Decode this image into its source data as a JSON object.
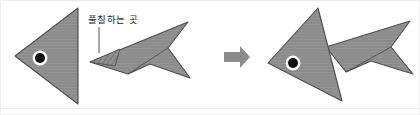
{
  "figure": {
    "title": "",
    "annotations": [
      {
        "id": "glue-label",
        "text": "풀칠하는 곳",
        "x": 88,
        "y": 15,
        "leader_line": {
          "x1": 99,
          "y1": 27,
          "x2": 99,
          "y2": 52
        }
      }
    ],
    "arrow": {
      "name": "process-arrow",
      "direction": "right",
      "x": 224,
      "y": 50,
      "width": 26,
      "height": 14
    },
    "colors": {
      "paper_fill": "#8c8c8c",
      "paper_fill_light": "#9a9a9a",
      "paper_fill_dark": "#808080",
      "outline": "#4d4d4d",
      "eye_pupil": "#111111",
      "eye_ring": "#ffffff",
      "arrow_fill": "#8c8c8c",
      "background": "#ffffff",
      "frame_border": "#e8e8e8",
      "hatch_stroke": "#5a5a5a"
    },
    "panels": [
      {
        "name": "before-assembly",
        "caption": "",
        "pieces": [
          {
            "name": "fish-body-triangle",
            "shape": "triangle",
            "points": "78,8 78,104 15,56",
            "fill": "#8c8c8c"
          },
          {
            "name": "fish-eye",
            "shape": "circle",
            "cx": 40,
            "cy": 58,
            "r": 5.2,
            "ring_r": 7.4
          },
          {
            "name": "fish-tail-dart",
            "shape": "polygon",
            "points": "90,62 188,22 168,48 190,78 150,64 128,74",
            "fill": "#8c8c8c"
          },
          {
            "name": "glue-tab-hatched",
            "shape": "polygon",
            "points": "90,62 118,50 112,66",
            "fill": "hatched"
          }
        ]
      },
      {
        "name": "after-assembly",
        "caption": "",
        "pieces": [
          {
            "name": "assembled-fish-body-triangle",
            "shape": "triangle",
            "points": "318,8 342,100 268,63",
            "fill": "#8c8c8c"
          },
          {
            "name": "assembled-fish-eye",
            "shape": "circle",
            "cx": 294,
            "cy": 63,
            "r": 5.2,
            "ring_r": 7.4
          },
          {
            "name": "assembled-fish-tail-dart",
            "shape": "polygon",
            "points": "326,48 410,22 390,48 412,74 370,62 344,72",
            "fill": "#8c8c8c"
          }
        ]
      }
    ]
  }
}
